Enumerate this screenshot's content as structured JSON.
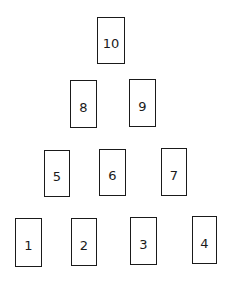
{
  "diagram": {
    "type": "pyramid-of-boxes",
    "rows": [
      {
        "row": 1,
        "boxes": [
          {
            "label": "10",
            "x": 97,
            "y": 17,
            "w": 28,
            "h": 47
          }
        ]
      },
      {
        "row": 2,
        "boxes": [
          {
            "label": "8",
            "x": 70,
            "y": 80,
            "w": 27,
            "h": 48
          },
          {
            "label": "9",
            "x": 129,
            "y": 79,
            "w": 27,
            "h": 48
          }
        ]
      },
      {
        "row": 3,
        "boxes": [
          {
            "label": "5",
            "x": 44,
            "y": 150,
            "w": 26,
            "h": 47
          },
          {
            "label": "6",
            "x": 99,
            "y": 149,
            "w": 27,
            "h": 47
          },
          {
            "label": "7",
            "x": 161,
            "y": 148,
            "w": 26,
            "h": 48
          }
        ]
      },
      {
        "row": 4,
        "boxes": [
          {
            "label": "1",
            "x": 15,
            "y": 218,
            "w": 27,
            "h": 49
          },
          {
            "label": "2",
            "x": 71,
            "y": 218,
            "w": 26,
            "h": 48
          },
          {
            "label": "3",
            "x": 130,
            "y": 217,
            "w": 27,
            "h": 48
          },
          {
            "label": "4",
            "x": 192,
            "y": 216,
            "w": 25,
            "h": 48
          }
        ]
      }
    ]
  },
  "labels": {
    "b10": "10",
    "b8": "8",
    "b9": "9",
    "b5": "5",
    "b6": "6",
    "b7": "7",
    "b1": "1",
    "b2": "2",
    "b3": "3",
    "b4": "4"
  }
}
